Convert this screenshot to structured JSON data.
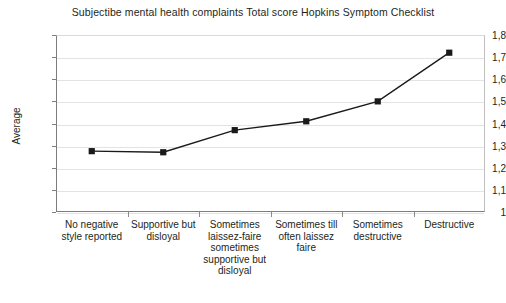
{
  "chart_data": {
    "type": "line",
    "title": "Subjectibe mental health complaints Total score Hopkins Symptom Checklist",
    "xlabel": "",
    "ylabel": "Average",
    "categories": [
      "No negative style reported",
      "Supportive but disloyal",
      "Sometimes laissez-faire sometimes supportive but disloyal",
      "Sometimes till often laissez faire",
      "Sometimes destructive",
      "Destructive"
    ],
    "values": [
      1.275,
      1.27,
      1.37,
      1.41,
      1.5,
      1.72
    ],
    "ylim": [
      1,
      1.8
    ],
    "ytick_labels": [
      "1,8",
      "1,7",
      "1,6",
      "1,5",
      "1,4",
      "1,3",
      "1,2",
      "1,1",
      "1"
    ],
    "ytick_values": [
      1.8,
      1.7,
      1.6,
      1.5,
      1.4,
      1.3,
      1.2,
      1.1,
      1
    ],
    "grid": true,
    "legend": "none",
    "marker": "square",
    "series_color": "#1a1a1a",
    "grid_color": "#e3e3e3",
    "axis_color": "#7d7d7d"
  }
}
